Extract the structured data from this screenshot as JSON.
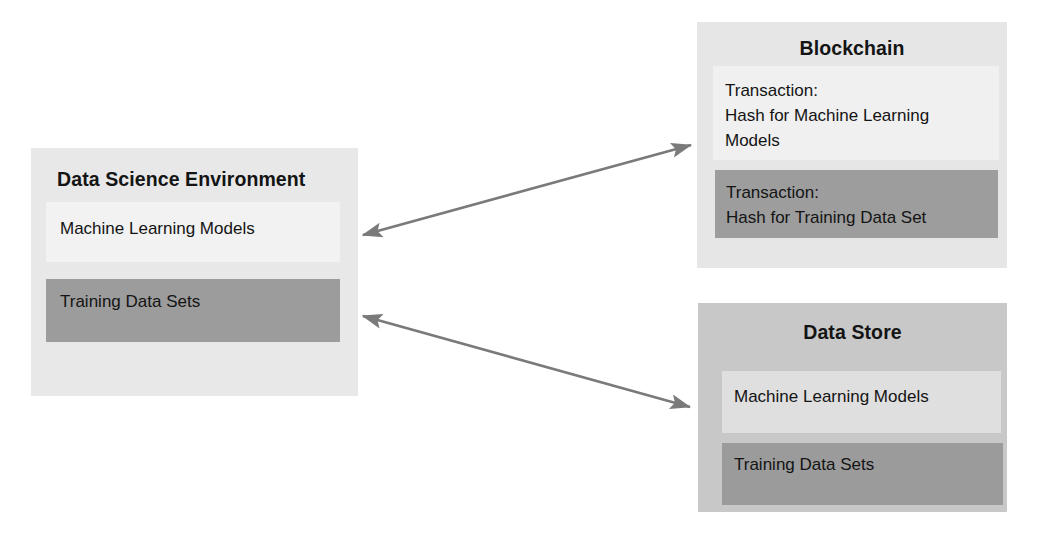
{
  "diagram": {
    "background_color": "#ffffff",
    "arrow_color": "#7a7a7a"
  },
  "data_science_environment": {
    "title": "Data Science Environment",
    "background_color": "#e8e8e8",
    "items": [
      {
        "label": "Machine Learning Models",
        "background_color": "#f2f2f2"
      },
      {
        "label": "Training Data Sets",
        "background_color": "#9c9c9c"
      }
    ]
  },
  "blockchain": {
    "title": "Blockchain",
    "background_color": "#e6e6e6",
    "items": [
      {
        "label": "Transaction:\nHash for Machine Learning\nModels",
        "background_color": "#f0f0f0"
      },
      {
        "label": "Transaction:\nHash for Training Data Set",
        "background_color": "#9d9d9d"
      }
    ]
  },
  "data_store": {
    "title": "Data Store",
    "background_color": "#c8c8c8",
    "items": [
      {
        "label": "Machine Learning Models",
        "background_color": "#dfdfdf"
      },
      {
        "label": "Training Data Sets",
        "background_color": "#9b9b9b"
      }
    ]
  },
  "connectors": [
    {
      "name": "dse-to-blockchain",
      "from": "Data Science Environment",
      "to": "Blockchain",
      "style": "double-headed-arrow"
    },
    {
      "name": "dse-to-data-store",
      "from": "Data Science Environment",
      "to": "Data Store",
      "style": "double-headed-arrow"
    }
  ]
}
